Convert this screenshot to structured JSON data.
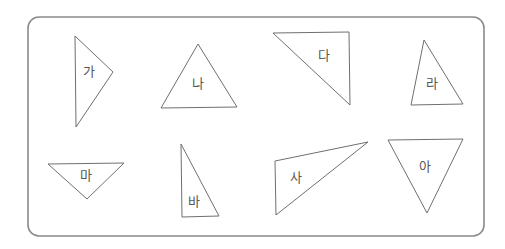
{
  "figure": {
    "frame": {
      "x": 28,
      "y": 17,
      "width": 456,
      "height": 219,
      "radius": 11
    },
    "stroke_color": "#6f6f6f",
    "frame_color": "#8a8a8a",
    "label_color": "#555555",
    "triangles": [
      {
        "label": "가",
        "points": "75,36 113,72 76,127",
        "label_pos": [
          89,
          72
        ]
      },
      {
        "label": "나",
        "points": "198,44 161,108 237,107",
        "label_pos": [
          198,
          84
        ]
      },
      {
        "label": "다",
        "points": "273,33 349,32 350,105",
        "label_pos": [
          324,
          56
        ]
      },
      {
        "label": "라",
        "points": "424,40 411,105 463,104",
        "label_pos": [
          432,
          84
        ]
      },
      {
        "label": "마",
        "points": "48,164 124,163 87,199",
        "label_pos": [
          86,
          176
        ]
      },
      {
        "label": "바",
        "points": "181,144 182,217 219,216",
        "label_pos": [
          194,
          202
        ]
      },
      {
        "label": "사",
        "points": "275,161 368,142 276,215",
        "label_pos": [
          296,
          178
        ]
      },
      {
        "label": "아",
        "points": "388,140 463,139 427,213",
        "label_pos": [
          425,
          167
        ]
      }
    ]
  }
}
